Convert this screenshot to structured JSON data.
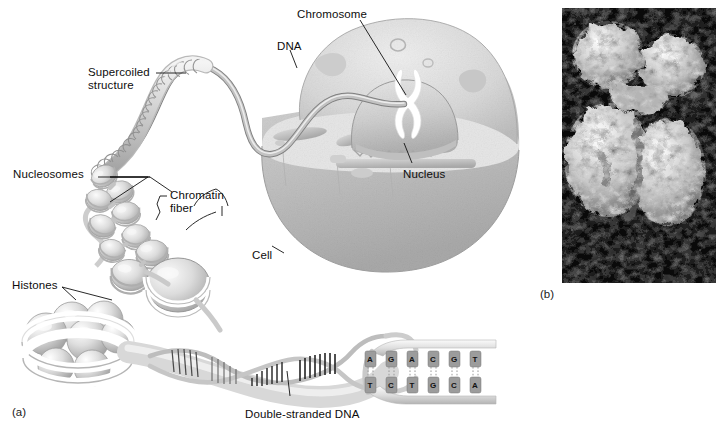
{
  "figure": {
    "panels": [
      {
        "id": "a",
        "label": "(a)",
        "x": 12,
        "y": 406,
        "kind": "illustration"
      },
      {
        "id": "b",
        "label": "(b)",
        "x": 540,
        "y": 288,
        "kind": "micrograph"
      }
    ]
  },
  "illustration": {
    "title": "DNA packaging in the eukaryotic cell",
    "labels": [
      {
        "name": "supercoiled-structure",
        "text": "Supercoiled\nstructure",
        "x": 88,
        "y": 66,
        "align": "left"
      },
      {
        "name": "nucleosomes",
        "text": "Nucleosomes",
        "x": 13,
        "y": 168,
        "align": "left"
      },
      {
        "name": "chromatin-fiber",
        "text": "Chromatin\nfiber",
        "x": 170,
        "y": 189,
        "align": "left"
      },
      {
        "name": "histones",
        "text": "Histones",
        "x": 12,
        "y": 279,
        "align": "left"
      },
      {
        "name": "double-stranded-dna",
        "text": "Double-stranded DNA",
        "x": 245,
        "y": 408,
        "align": "left"
      },
      {
        "name": "chromosome",
        "text": "Chromosome",
        "x": 297,
        "y": 8,
        "align": "left"
      },
      {
        "name": "dna",
        "text": "DNA",
        "x": 277,
        "y": 40,
        "align": "left"
      },
      {
        "name": "nucleus",
        "text": "Nucleus",
        "x": 403,
        "y": 168,
        "align": "left"
      },
      {
        "name": "cell",
        "text": "Cell",
        "x": 252,
        "y": 249,
        "align": "left"
      }
    ],
    "structures": [
      "cell-body",
      "nucleus-dome",
      "chromosome-x",
      "endoplasmic-reticulum",
      "dna-strand",
      "supercoiled-coil",
      "nucleosome-chain",
      "histone-octamer",
      "dna-double-helix",
      "dna-base-ladder"
    ]
  },
  "dna_sequence": {
    "top_strand": [
      "A",
      "G",
      "A",
      "C",
      "G",
      "T"
    ],
    "bottom_strand": [
      "T",
      "C",
      "T",
      "G",
      "C",
      "A"
    ],
    "pairs": 6
  },
  "micrograph": {
    "alt": "Scanning electron micrograph of a metaphase chromosome",
    "frame": {
      "x": 562,
      "y": 8,
      "width": 154,
      "height": 275
    },
    "background": "#0a0a0a"
  },
  "colors": {
    "ink": "#0d0d0d",
    "cell_fill": "#c9c9c9",
    "cell_shade": "#b3b3b3",
    "nucleus_fill": "#d6d6d6",
    "organelle": "#bdbdbd",
    "strand": "#a8a8a8",
    "strand_light": "#e4e4e4",
    "base_box": "#8e8e8e",
    "micrograph_bg": "#0a0a0a",
    "micrograph_fg": "#d8d8d8"
  }
}
